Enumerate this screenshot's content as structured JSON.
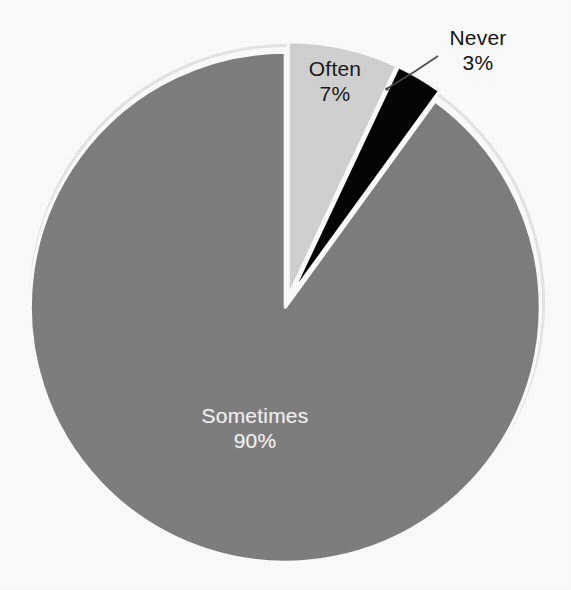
{
  "chart_data": {
    "type": "pie",
    "title": "",
    "subtitle": "",
    "xlabel": "",
    "ylabel": "",
    "legend_position": "none",
    "grid": false,
    "value_unit": "percent",
    "start_angle_deg": 0,
    "direction": "clockwise",
    "categories": [
      "Often",
      "Never",
      "Sometimes"
    ],
    "values": [
      7,
      3,
      90
    ],
    "labels": [
      "Often 7%",
      "Never 3%",
      "Sometimes 90%"
    ],
    "slices": [
      {
        "name": "Often",
        "value": 7,
        "value_text": "7%",
        "color": "#d4d4d4",
        "label_placement": "inside",
        "label_color": "#1a1a1a",
        "start_angle_deg": 0,
        "end_angle_deg": 25.2,
        "has_leader_line": false
      },
      {
        "name": "Never",
        "value": 3,
        "value_text": "3%",
        "color": "#050505",
        "label_placement": "outside",
        "label_color": "#141414",
        "start_angle_deg": 25.2,
        "end_angle_deg": 36.0,
        "has_leader_line": true
      },
      {
        "name": "Sometimes",
        "value": 90,
        "value_text": "90%",
        "color": "#808080",
        "label_placement": "inside",
        "label_color": "#f2f2f2",
        "start_angle_deg": 36.0,
        "end_angle_deg": 360.0,
        "has_leader_line": false
      }
    ]
  },
  "chart": {
    "background_color": "#ffffff",
    "separator_color": "#ffffff",
    "rim_color": "#e8e8e8",
    "center_x": 287,
    "center_y": 302,
    "radius": 255
  },
  "labels": {
    "often": {
      "name": "Often",
      "value": "7%"
    },
    "never": {
      "name": "Never",
      "value": "3%"
    },
    "sometimes": {
      "name": "Sometimes",
      "value": "90%"
    }
  }
}
